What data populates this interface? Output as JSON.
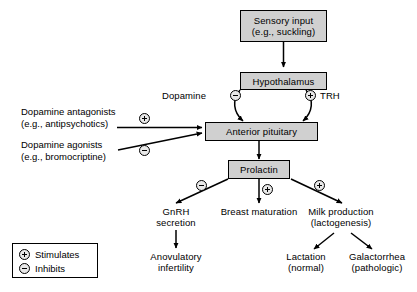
{
  "diagram": {
    "boxes": [
      {
        "id": "sensory",
        "line1": "Sensory input",
        "line2": "(e.g., suckling)"
      },
      {
        "id": "hypothalamus",
        "line1": "Hypothalamus"
      },
      {
        "id": "anterior_pituitary",
        "line1": "Anterior pituitary"
      },
      {
        "id": "prolactin",
        "line1": "Prolactin"
      }
    ],
    "mediators": {
      "dopamine": "Dopamine",
      "trh": "TRH"
    },
    "drugs": [
      {
        "line1": "Dopamine antagonists",
        "line2": "(e.g., antipsychotics)",
        "effect": "stimulates"
      },
      {
        "line1": "Dopamine agonists",
        "line2": "(e.g., bromocriptine)",
        "effect": "inhibits"
      }
    ],
    "effects": [
      {
        "id": "gnrh",
        "line1": "GnRH",
        "line2": "secretion",
        "sign": "inhibits"
      },
      {
        "id": "breast",
        "line1": "Breast maturation",
        "line2": "",
        "sign": "stimulates"
      },
      {
        "id": "milk",
        "line1": "Milk production",
        "line2": "(lactogenesis)",
        "sign": "stimulates"
      }
    ],
    "outcomes": [
      {
        "id": "anovulatory",
        "line1": "Anovulatory",
        "line2": "infertility"
      },
      {
        "id": "lactation",
        "line1": "Lactation",
        "line2": "(normal)"
      },
      {
        "id": "galactorrhea",
        "line1": "Galactorrhea",
        "line2": "(pathologic)"
      }
    ],
    "legend": [
      {
        "sign": "plus",
        "label": "Stimulates"
      },
      {
        "sign": "minus",
        "label": "Inhibits"
      }
    ],
    "colors": {
      "box_fill": "#d0d0d0",
      "stroke": "#000000",
      "background": "#ffffff"
    }
  }
}
